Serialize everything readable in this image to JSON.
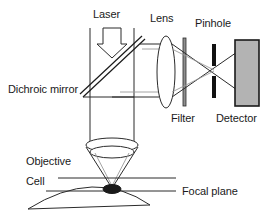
{
  "figure": {
    "background_color": "#ffffff",
    "line_color": "#2b2b2b",
    "faint_ray_color": "#9a9a9a",
    "detector_fill": "#b3b3b3",
    "pinhole_color": "#111111"
  },
  "labels": {
    "laser": "Laser",
    "lens": "Lens",
    "pinhole": "Pinhole",
    "dichroic_mirror": "Dichroic mirror",
    "filter": "Filter",
    "detector": "Detector",
    "objective": "Objective",
    "cell": "Cell",
    "focal_plane": "Focal plane"
  },
  "components": {
    "laser_arrow": {
      "name": "downward block arrow",
      "direction": "down"
    },
    "excitation_beam": {
      "name": "vertical laser beam",
      "lines": 2
    },
    "dichroic_mirror": {
      "name": "tilted double-line mirror",
      "angle_deg": -45
    },
    "lens": {
      "name": "tall narrow ellipse lens"
    },
    "filter": {
      "name": "thin vertical bar"
    },
    "pinhole": {
      "name": "two black bars with central aperture"
    },
    "detector": {
      "name": "gray filled rectangle"
    },
    "objective": {
      "name": "elliptical lens with converging cone"
    },
    "cell": {
      "name": "flattened dome specimen"
    },
    "focal_spot": {
      "name": "dark ellipse at focus"
    },
    "focal_plane_lines": {
      "name": "two horizontal plane lines",
      "count": 2
    }
  }
}
